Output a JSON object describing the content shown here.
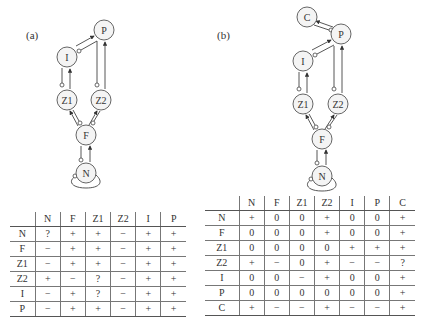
{
  "panels": [
    {
      "label": "(a)",
      "nodes": [
        {
          "id": "P",
          "label": "P",
          "x": 104,
          "y": 30
        },
        {
          "id": "I",
          "label": "I",
          "x": 67,
          "y": 57
        },
        {
          "id": "Z1",
          "label": "Z1",
          "x": 67,
          "y": 100
        },
        {
          "id": "Z2",
          "label": "Z2",
          "x": 101,
          "y": 100
        },
        {
          "id": "F",
          "label": "F",
          "x": 86,
          "y": 135
        },
        {
          "id": "N",
          "label": "N",
          "x": 86,
          "y": 173
        }
      ],
      "table": {
        "columns": [
          "N",
          "F",
          "Z1",
          "Z2",
          "I",
          "P"
        ],
        "rows": [
          {
            "label": "N",
            "values": [
              "?",
              "+",
              "+",
              "−",
              "+",
              "+"
            ]
          },
          {
            "label": "F",
            "values": [
              "−",
              "+",
              "+",
              "−",
              "+",
              "+"
            ]
          },
          {
            "label": "Z1",
            "values": [
              "−",
              "+",
              "+",
              "−",
              "+",
              "+"
            ]
          },
          {
            "label": "Z2",
            "values": [
              "+",
              "−",
              "?",
              "−",
              "+",
              "+"
            ]
          },
          {
            "label": "I",
            "values": [
              "−",
              "+",
              "?",
              "−",
              "+",
              "+"
            ]
          },
          {
            "label": "P",
            "values": [
              "−",
              "+",
              "+",
              "−",
              "+",
              "+"
            ]
          }
        ]
      }
    },
    {
      "label": "(b)",
      "nodes": [
        {
          "id": "C",
          "label": "C",
          "x": 307,
          "y": 17
        },
        {
          "id": "P",
          "label": "P",
          "x": 341,
          "y": 34
        },
        {
          "id": "I",
          "label": "I",
          "x": 303,
          "y": 61
        },
        {
          "id": "Z1",
          "label": "Z1",
          "x": 303,
          "y": 104
        },
        {
          "id": "Z2",
          "label": "Z2",
          "x": 338,
          "y": 104
        },
        {
          "id": "F",
          "label": "F",
          "x": 322,
          "y": 139
        },
        {
          "id": "N",
          "label": "N",
          "x": 322,
          "y": 176
        }
      ],
      "table": {
        "columns": [
          "N",
          "F",
          "Z1",
          "Z2",
          "I",
          "P",
          "C"
        ],
        "rows": [
          {
            "label": "N",
            "values": [
              "+",
              "0",
              "0",
              "+",
              "0",
              "0",
              "+"
            ]
          },
          {
            "label": "F",
            "values": [
              "0",
              "0",
              "0",
              "+",
              "0",
              "0",
              "+"
            ]
          },
          {
            "label": "Z1",
            "values": [
              "0",
              "0",
              "0",
              "0",
              "+",
              "+",
              "+"
            ]
          },
          {
            "label": "Z2",
            "values": [
              "+",
              "−",
              "0",
              "+",
              "−",
              "−",
              "?"
            ]
          },
          {
            "label": "I",
            "values": [
              "0",
              "0",
              "−",
              "+",
              "0",
              "0",
              "+"
            ]
          },
          {
            "label": "P",
            "values": [
              "0",
              "0",
              "0",
              "0",
              "0",
              "0",
              "+"
            ]
          },
          {
            "label": "C",
            "values": [
              "+",
              "−",
              "−",
              "+",
              "−",
              "−",
              "+"
            ]
          }
        ]
      }
    }
  ]
}
